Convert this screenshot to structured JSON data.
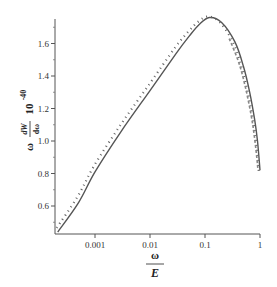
{
  "chart_data": {
    "type": "line",
    "title": "",
    "xlabel": "ω / E",
    "ylabel": "ω (dW/dω) 10^-40",
    "xlabel_parts": {
      "numerator": "ω",
      "denominator": "E"
    },
    "ylabel_parts": {
      "prefix": "ω",
      "numerator": "dW",
      "denominator": "dω",
      "factor": "10",
      "exponent": "-40"
    },
    "x_scale": "log",
    "xlim": [
      0.00019,
      1.0
    ],
    "ylim": [
      0.42,
      1.77
    ],
    "x_ticks": [
      {
        "value": 0.001,
        "label": "0.001"
      },
      {
        "value": 0.01,
        "label": "0.01"
      },
      {
        "value": 0.1,
        "label": "0.1"
      },
      {
        "value": 1,
        "label": "1"
      }
    ],
    "y_ticks": [
      {
        "value": 0.6,
        "label": "0.6"
      },
      {
        "value": 0.8,
        "label": "0.8"
      },
      {
        "value": 1.0,
        "label": "1.0"
      },
      {
        "value": 1.2,
        "label": "1.2"
      },
      {
        "value": 1.4,
        "label": "1.4"
      },
      {
        "value": 1.6,
        "label": "1.6"
      }
    ],
    "grid": false,
    "legend": null,
    "series": [
      {
        "name": "solid",
        "style": "solid",
        "x": [
          0.00021,
          0.0005,
          0.001,
          0.003,
          0.01,
          0.03,
          0.053,
          0.08,
          0.12,
          0.2,
          0.35,
          0.5,
          0.65,
          0.8,
          0.9,
          1.0
        ],
        "y": [
          0.44,
          0.62,
          0.81,
          1.06,
          1.31,
          1.54,
          1.65,
          1.72,
          1.76,
          1.73,
          1.61,
          1.46,
          1.3,
          1.13,
          1.0,
          0.82
        ]
      },
      {
        "name": "dotted",
        "style": "dotted",
        "x": [
          0.00021,
          0.0005,
          0.001,
          0.003,
          0.01,
          0.03,
          0.053,
          0.08,
          0.12,
          0.2,
          0.35,
          0.5,
          0.65,
          0.8,
          0.9,
          1.0
        ],
        "y": [
          0.46,
          0.65,
          0.84,
          1.09,
          1.34,
          1.57,
          1.67,
          1.73,
          1.76,
          1.72,
          1.59,
          1.43,
          1.27,
          1.1,
          0.97,
          0.8
        ]
      },
      {
        "name": "dashed",
        "style": "dashed",
        "x": [
          0.3,
          0.45,
          0.6,
          0.75,
          0.85,
          0.95,
          1.0
        ],
        "y": [
          1.63,
          1.48,
          1.32,
          1.16,
          1.04,
          0.9,
          0.82
        ]
      }
    ]
  }
}
